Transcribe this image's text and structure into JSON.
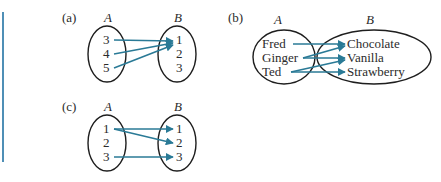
{
  "colors": {
    "arrow": "#2a7a96",
    "side_bar": "#4f8fb6",
    "text": "#2b2b2b",
    "oval_stroke": "#1e1e1e"
  },
  "panels": [
    {
      "label": "(a)",
      "domain_name": "A",
      "codomain_name": "B",
      "domain": [
        "3",
        "4",
        "5"
      ],
      "codomain": [
        "1",
        "2",
        "3"
      ],
      "mappings": [
        [
          "3",
          "1"
        ],
        [
          "4",
          "1"
        ],
        [
          "5",
          "1"
        ]
      ]
    },
    {
      "label": "(b)",
      "domain_name": "A",
      "codomain_name": "B",
      "domain": [
        "Fred",
        "Ginger",
        "Ted"
      ],
      "codomain": [
        "Chocolate",
        "Vanilla",
        "Strawberry"
      ],
      "mappings": [
        [
          "Fred",
          "Chocolate"
        ],
        [
          "Ginger",
          "Chocolate"
        ],
        [
          "Ginger",
          "Vanilla"
        ],
        [
          "Ted",
          "Vanilla"
        ],
        [
          "Ted",
          "Strawberry"
        ]
      ]
    },
    {
      "label": "(c)",
      "domain_name": "A",
      "codomain_name": "B",
      "domain": [
        "1",
        "2",
        "3"
      ],
      "codomain": [
        "1",
        "2",
        "3"
      ],
      "mappings": [
        [
          "1",
          "1"
        ],
        [
          "1",
          "2"
        ],
        [
          "3",
          "3"
        ]
      ]
    }
  ]
}
